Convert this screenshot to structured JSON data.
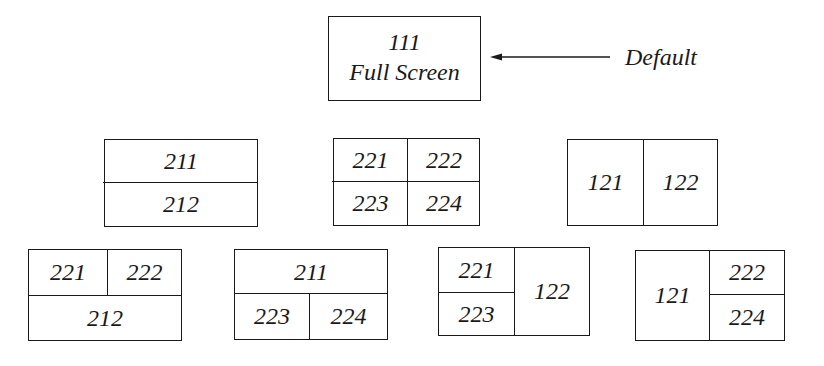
{
  "root": {
    "code": "111",
    "label": "Full Screen",
    "annotation": "Default"
  },
  "level2": [
    {
      "layout": "horizontal-split",
      "cells": [
        "211",
        "212"
      ]
    },
    {
      "layout": "quad",
      "cells": [
        "221",
        "222",
        "223",
        "224"
      ]
    },
    {
      "layout": "vertical-split",
      "cells": [
        "121",
        "122"
      ]
    }
  ],
  "level3": [
    {
      "layout": "top-split-bottom-full",
      "cells": [
        "221",
        "222",
        "212"
      ]
    },
    {
      "layout": "top-full-bottom-split",
      "cells": [
        "211",
        "223",
        "224"
      ]
    },
    {
      "layout": "left-split-right-full",
      "cells": [
        "221",
        "223",
        "122"
      ]
    },
    {
      "layout": "left-full-right-split",
      "cells": [
        "121",
        "222",
        "224"
      ]
    }
  ]
}
